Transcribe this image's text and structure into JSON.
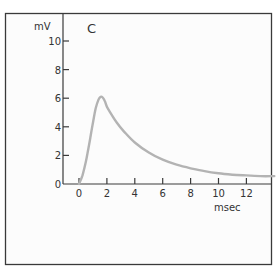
{
  "chart_data": {
    "type": "line",
    "title": "C",
    "xlabel": "msec",
    "ylabel": "mV",
    "xlim": [
      -1.2,
      14
    ],
    "ylim": [
      0,
      11
    ],
    "x_ticks": [
      0,
      2,
      4,
      6,
      8,
      10,
      12
    ],
    "x_tick_labels": [
      "0",
      "2",
      "4",
      "6",
      "8",
      "10",
      "12"
    ],
    "y_ticks": [
      0,
      2,
      4,
      6,
      8,
      10
    ],
    "y_tick_labels": [
      "0",
      "2",
      "4",
      "6",
      "8",
      "10"
    ],
    "grid": false,
    "series": [
      {
        "name": "potential",
        "color": "#b3b3b3",
        "x": [
          0,
          0.25,
          0.5,
          0.75,
          1.0,
          1.2,
          1.4,
          1.55,
          1.7,
          1.85,
          2.0,
          2.3,
          2.7,
          3.2,
          4.0,
          5.0,
          6.0,
          7.0,
          8.0,
          9.0,
          10.0,
          11.0,
          12.0,
          13.0,
          14.0
        ],
        "y": [
          0,
          0.6,
          1.6,
          2.9,
          4.3,
          5.3,
          5.9,
          6.1,
          6.05,
          5.8,
          5.4,
          4.9,
          4.3,
          3.7,
          2.9,
          2.2,
          1.7,
          1.35,
          1.1,
          0.9,
          0.75,
          0.65,
          0.6,
          0.55,
          0.55
        ]
      }
    ]
  },
  "colors": {
    "frame": "#3a3a3a",
    "axis": "#3a3a3a",
    "curve": "#b3b3b3",
    "background": "#ffffff"
  }
}
